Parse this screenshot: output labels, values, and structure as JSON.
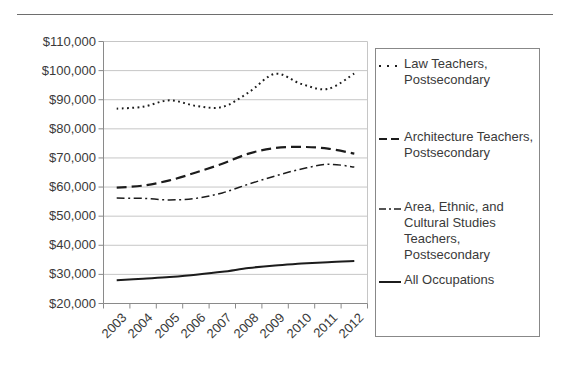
{
  "colors": {
    "background": "#ffffff",
    "series_line": "#1c1c1c",
    "gridline": "#c6c6c6",
    "axis": "#8a8a8a",
    "text": "#3a3a3a",
    "legend_border": "#888888"
  },
  "chart_data": {
    "type": "line",
    "title": "",
    "xlabel": "",
    "ylabel": "",
    "grid": true,
    "legend_position": "right",
    "ylim": [
      20000,
      110000
    ],
    "y_tick_step": 10000,
    "y_tick_labels": [
      "$110,000",
      "$100,000",
      "$90,000",
      "$80,000",
      "$70,000",
      "$60,000",
      "$50,000",
      "$40,000",
      "$30,000",
      "$20,000"
    ],
    "categories": [
      "2003",
      "2004",
      "2005",
      "2006",
      "2007",
      "2008",
      "2009",
      "2010",
      "2011",
      "2012"
    ],
    "series": [
      {
        "id": "law-teachers",
        "name": "Law Teachers, Postsecondary",
        "line_style": "dotted",
        "values": [
          86900,
          87600,
          89800,
          87900,
          87500,
          92500,
          98900,
          95400,
          93700,
          99000
        ]
      },
      {
        "id": "architecture-teachers",
        "name": "Architecture Teachers, Postsecondary",
        "line_style": "dashed",
        "values": [
          59800,
          60500,
          62300,
          65000,
          68000,
          71500,
          73400,
          73800,
          73200,
          71500
        ]
      },
      {
        "id": "area-ethnic-cultural-studies-teachers",
        "name": "Area, Ethnic, and Cultural Studies Teachers, Postsecondary",
        "line_style": "dashdot",
        "values": [
          56200,
          56100,
          55600,
          56100,
          58000,
          61000,
          63800,
          66200,
          67800,
          66900
        ]
      },
      {
        "id": "all-occupations",
        "name": "All Occupations",
        "line_style": "solid",
        "values": [
          28000,
          28500,
          29100,
          29900,
          30900,
          32200,
          33100,
          33700,
          34200,
          34600
        ]
      }
    ]
  }
}
